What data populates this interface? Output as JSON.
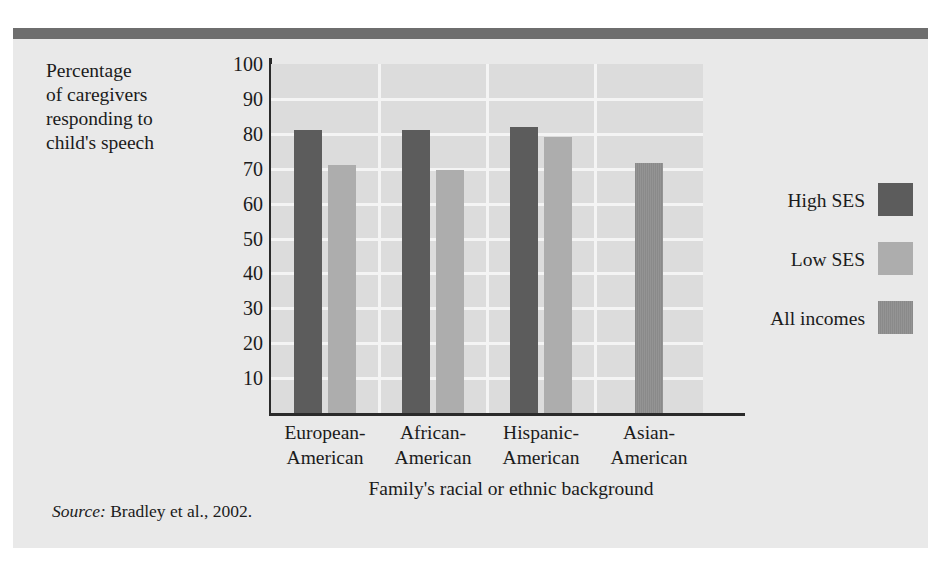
{
  "figure": {
    "y_caption": "Percentage\nof caregivers\nresponding to\nchild's speech",
    "source_word": "Source:",
    "source_text": " Bradley et al., 2002."
  },
  "chart_data": {
    "type": "bar",
    "title": "",
    "xlabel": "Family's racial or ethnic background",
    "ylabel": "Percentage of caregivers responding to child's speech",
    "categories": [
      "European-\nAmerican",
      "African-\nAmerican",
      "Hispanic-\nAmerican",
      "Asian-\nAmerican"
    ],
    "category_names": [
      "European-American",
      "African-American",
      "Hispanic-American",
      "Asian-American"
    ],
    "series": [
      {
        "name": "High SES",
        "color": "#5c5c5c",
        "values": [
          81,
          81,
          82,
          null
        ]
      },
      {
        "name": "Low SES",
        "color": "#adadad",
        "values": [
          71,
          69.5,
          79,
          null
        ]
      },
      {
        "name": "All incomes",
        "color": "#8a8a8a",
        "values": [
          null,
          null,
          null,
          71.5
        ]
      }
    ],
    "ylim": [
      0,
      100
    ],
    "yticks": [
      100,
      90,
      80,
      70,
      60,
      50,
      40,
      30,
      20,
      10
    ],
    "grid": true,
    "legend_position": "right"
  },
  "legend": {
    "items": [
      {
        "label": "High SES",
        "swatch": "#5c5c5c"
      },
      {
        "label": "Low SES",
        "swatch": "#adadad"
      },
      {
        "label": "All incomes",
        "swatch": "#8a8a8a"
      }
    ]
  },
  "colors": {
    "page_background": "#ffffff",
    "figure_background": "#e9e9e9",
    "plot_background": "#dcdcdc",
    "gridline": "#f4f4f4",
    "axis": "#2a2a2a",
    "top_rule": "#6e6e6e",
    "text": "#1b1b1b"
  }
}
